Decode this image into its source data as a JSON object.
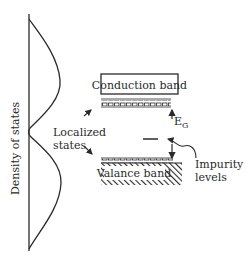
{
  "diagram": {
    "axis_label": "Density of states",
    "conduction_band_label": "Conduction band",
    "valance_band_label": "Valance band",
    "localized_states_label_line1": "Localized",
    "localized_states_label_line2": "states",
    "energy_gap_label_main": "E",
    "energy_gap_label_sub": "G",
    "impurity_label_line1": "Impurity",
    "impurity_label_line2": "levels"
  },
  "colors": {
    "ink": "#2a2a2a",
    "background": "#ffffff"
  }
}
